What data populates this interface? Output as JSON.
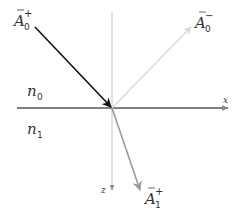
{
  "diagram": {
    "title": "",
    "media": {
      "upper": {
        "symbol": "n",
        "subscript": "0"
      },
      "lower": {
        "symbol": "n",
        "subscript": "1"
      }
    },
    "axes": {
      "x": {
        "label": "x"
      },
      "z": {
        "label": "z"
      }
    },
    "vectors": {
      "incident": {
        "symbol": "A",
        "subscript": "0",
        "superscript": "+",
        "color": "#111111"
      },
      "reflected": {
        "symbol": "A",
        "subscript": "0",
        "superscript": "−",
        "color": "#d9d9d9"
      },
      "transmitted": {
        "symbol": "A",
        "subscript": "1",
        "superscript": "+",
        "color": "#9a9a9a"
      }
    },
    "colors": {
      "interface": "#555555",
      "z_axis": "#c8c8c8"
    }
  }
}
